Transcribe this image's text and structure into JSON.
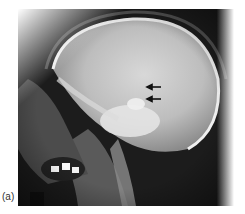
{
  "figure": {
    "panel_label": "(a)",
    "annotations": [
      {
        "type": "arrow",
        "direction": "left",
        "x": 147,
        "y": 87
      },
      {
        "type": "arrow",
        "direction": "left",
        "x": 147,
        "y": 99
      }
    ],
    "colors": {
      "background": "#ffffff",
      "film_dark": "#1a1a1a",
      "bone_light": "#e8e8e8",
      "arrow": "#111111"
    }
  }
}
